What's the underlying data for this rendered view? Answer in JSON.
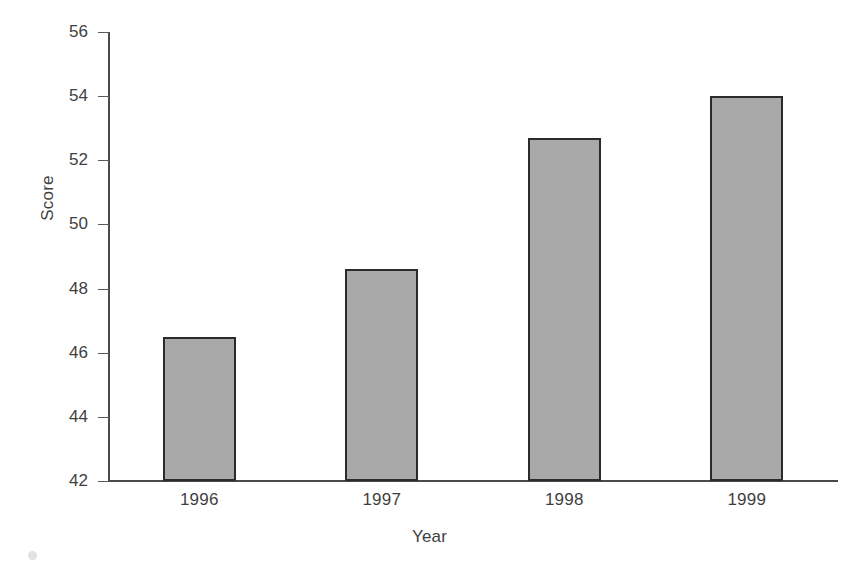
{
  "chart_data": {
    "type": "bar",
    "title": "",
    "xlabel": "Year",
    "ylabel": "Score",
    "categories": [
      "1996",
      "1997",
      "1998",
      "1999"
    ],
    "values": [
      46.5,
      48.6,
      52.7,
      54.0
    ],
    "ylim": [
      42,
      56
    ],
    "yticks": [
      42,
      44,
      46,
      48,
      50,
      52,
      54,
      56
    ],
    "ytick_labels": [
      "42",
      "44",
      "46",
      "48",
      "50",
      "52",
      "54",
      "56"
    ],
    "grid": false,
    "legend": null,
    "series": [
      {
        "name": "Score",
        "values": [
          46.5,
          48.6,
          52.7,
          54.0
        ]
      }
    ],
    "colors": {
      "bar_fill": "#a9a9a9",
      "bar_edge": "#2b2b2b",
      "axis": "#4a4a4a",
      "text": "#3f3f3f",
      "background": "#ffffff"
    }
  }
}
